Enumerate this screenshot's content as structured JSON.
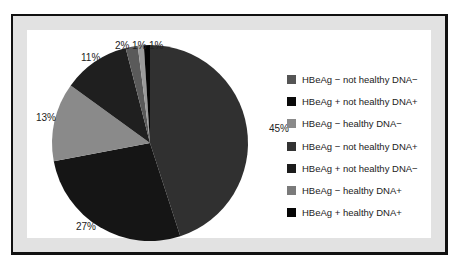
{
  "chart_data": {
    "type": "pie",
    "title": "",
    "start_angle_deg": 0,
    "direction": "clockwise",
    "slices": [
      {
        "label": "HBeAg − not healthy DNA+",
        "value": 45,
        "display": "45%",
        "color": "#303030"
      },
      {
        "label": "HBeAg + not healthy DNA+",
        "value": 27,
        "display": "27%",
        "color": "#151515"
      },
      {
        "label": "HBeAg − healthy DNA−",
        "value": 13,
        "display": "13%",
        "color": "#8a8a8a"
      },
      {
        "label": "HBeAg + not healthy DNA−",
        "value": 11,
        "display": "11%",
        "color": "#1f1f1f"
      },
      {
        "label": "HBeAg − not healthy DNA−",
        "value": 2,
        "display": "2%",
        "color": "#5a5a5a"
      },
      {
        "label": "HBeAg − healthy DNA+",
        "value": 1,
        "display": "1%",
        "color": "#9a9a9a"
      },
      {
        "label": "HBeAg + healthy DNA+",
        "value": 1,
        "display": "1%",
        "color": "#050505"
      }
    ],
    "legend_position": "right",
    "legend": [
      {
        "label": "HBeAg − not healthy DNA−",
        "color": "#555555"
      },
      {
        "label": "HBeAg + not healthy DNA+",
        "color": "#0a0a0a"
      },
      {
        "label": "HBeAg − healthy DNA−",
        "color": "#8a8a8a"
      },
      {
        "label": "HBeAg − not healthy DNA+",
        "color": "#333333"
      },
      {
        "label": "HBeAg + not healthy DNA−",
        "color": "#1c1c1c"
      },
      {
        "label": "HBeAg − healthy DNA+",
        "color": "#7a7a7a"
      },
      {
        "label": "HBeAg + healthy DNA+",
        "color": "#050505"
      }
    ]
  },
  "labels": {
    "p45": "45%",
    "p27": "27%",
    "p13": "13%",
    "p11": "11%",
    "p2": "2%",
    "p1a": "1%",
    "p1b": "1%"
  }
}
